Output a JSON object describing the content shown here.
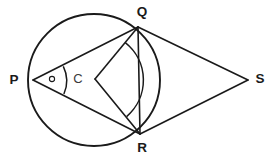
{
  "figure": {
    "canvas": {
      "width": 276,
      "height": 160,
      "background": "#ffffff"
    },
    "stroke_color": "#1a1a1a",
    "labels": {
      "P": "P",
      "Q": "Q",
      "R": "R",
      "S": "S",
      "C": "C"
    },
    "points": {
      "P": {
        "x": 33,
        "y": 80
      },
      "Q": {
        "x": 138,
        "y": 27
      },
      "R": {
        "x": 140,
        "y": 134
      },
      "S": {
        "x": 248,
        "y": 80
      },
      "C": {
        "x": 95,
        "y": 79
      }
    },
    "label_positions": {
      "P": {
        "x": 14,
        "y": 80
      },
      "Q": {
        "x": 142,
        "y": 12
      },
      "R": {
        "x": 142,
        "y": 148
      },
      "S": {
        "x": 258,
        "y": 79
      },
      "C": {
        "x": 73,
        "y": 80
      }
    },
    "circle": {
      "center": {
        "x": 94,
        "y": 80
      },
      "radius": 66
    },
    "segments": [
      {
        "name": "PQ",
        "from": "P",
        "to": "Q"
      },
      {
        "name": "PR",
        "from": "P",
        "to": "R"
      },
      {
        "name": "QR",
        "from": "Q",
        "to": "R"
      },
      {
        "name": "QS",
        "from": "Q",
        "to": "S"
      },
      {
        "name": "RS",
        "from": "R",
        "to": "S"
      },
      {
        "name": "CQ",
        "from": "C",
        "to": "Q"
      },
      {
        "name": "CR",
        "from": "C",
        "to": "R"
      }
    ],
    "angle_marks": [
      {
        "name": "angle-QPR-arc",
        "vertex": "P",
        "type": "arc",
        "radius": 33,
        "description": "inscribed angle QPR marked with single arc"
      },
      {
        "name": "angle-QPR-dot",
        "vertex": "P",
        "type": "dot",
        "at": {
          "x": 52,
          "y": 79
        },
        "radius": 2.6,
        "description": "small circle marker inside angle QPR"
      },
      {
        "name": "angle-QCR-arc",
        "vertex": "C",
        "type": "arc",
        "radius": 48,
        "description": "central angle QCR marked with single arc bulging toward the right"
      }
    ]
  }
}
